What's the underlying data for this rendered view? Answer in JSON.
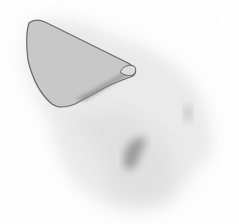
{
  "image": {
    "description": "Grayscale scintigraphy-style scan with an outlined region of interest",
    "background_color": "#ffffff",
    "body_tint": "#e4e4e4",
    "roi_fill": "#c9c9c9",
    "roi_stroke": "#6a6a6a",
    "hot_spot_color": "#8a8a8a"
  }
}
